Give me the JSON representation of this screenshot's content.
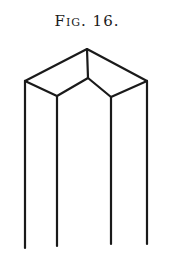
{
  "caption": "Fig. 16.",
  "figure": {
    "stroke_color": "#1a1a1a",
    "vertices": {
      "apex": [
        87,
        49
      ],
      "left_corner": [
        25,
        81
      ],
      "right_corner": [
        147,
        81
      ],
      "center_top": [
        88,
        78
      ],
      "left_inner": [
        57,
        96
      ],
      "right_inner": [
        111,
        97
      ]
    },
    "vertical_edges_bottom_y": [
      248,
      246,
      244,
      244
    ]
  }
}
